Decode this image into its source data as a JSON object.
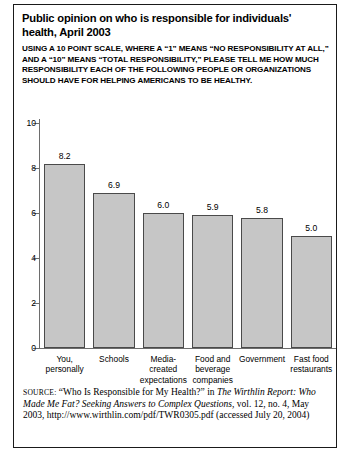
{
  "title": "Public opinion on who is responsible for individuals' health, April 2003",
  "subtitle_lines": [
    "USING A 10 POINT SCALE, WHERE A “1” MEANS “NO RESPONSIBILITY AT ALL,”",
    "AND A “10” MEANS “TOTAL RESPONSIBILITY,” PLEASE TELL ME HOW MUCH",
    "RESPONSIBILITY EACH OF THE FOLLOWING PEOPLE OR ORGANIZATIONS",
    "SHOULD HAVE FOR HELPING AMERICANS TO BE HEALTHY."
  ],
  "colors": {
    "bar_fill": "#c6c6c6",
    "bar_edge": "#4a4a4a",
    "axis": "#6d6d6d",
    "border": "#1a1a1a",
    "text": "#000000"
  },
  "chart_data": {
    "type": "bar",
    "title": "Public opinion on who is responsible for individuals' health, April 2003",
    "xlabel": "",
    "ylabel": "",
    "ylim": [
      0,
      10
    ],
    "yticks": [
      0,
      2,
      4,
      6,
      8,
      10
    ],
    "grid": false,
    "legend": null,
    "categories": [
      "You, personally",
      "Schools",
      "Media-created expectations",
      "Food and beverage companies",
      "Government",
      "Fast food restaurants"
    ],
    "category_lines": [
      [
        "You,",
        "personally"
      ],
      [
        "Schools"
      ],
      [
        "Media-",
        "created",
        "expectations"
      ],
      [
        "Food and",
        "beverage",
        "companies"
      ],
      [
        "Government"
      ],
      [
        "Fast food",
        "restaurants"
      ]
    ],
    "values": [
      8.2,
      6.9,
      6.0,
      5.9,
      5.8,
      5.0
    ],
    "value_labels": [
      "8.2",
      "6.9",
      "6.0",
      "5.9",
      "5.8",
      "5.0"
    ]
  },
  "source": {
    "label": "SOURCE:",
    "text_1": " “Who Is Responsible for My Health?” in ",
    "italic_1": "The Wirthlin Report: Who Made Me Fat? Seeking Answers to Complex Questions,",
    "text_2": " vol. 12, no. 4, May 2003, http://www.wirthlin.com/pdf/TWR0305.pdf (accessed July 20, 2004)"
  }
}
